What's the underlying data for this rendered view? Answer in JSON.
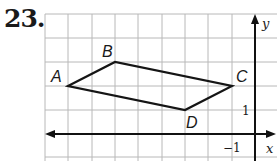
{
  "problem": {
    "number": "23."
  },
  "graph": {
    "origin_px": [
      255,
      134
    ],
    "unit_px": 23.4,
    "x_range": [
      -9,
      0.9
    ],
    "y_range": [
      -1,
      5
    ],
    "axis_labels": {
      "x": "x",
      "y": "y"
    },
    "tick_labels": {
      "x": "−1",
      "y": "1"
    },
    "grid_color": "#b8b8b8",
    "line_color": "#151515"
  },
  "figure": {
    "type": "parallelogram",
    "vertices": [
      {
        "label": "A",
        "x": -8,
        "y": 2
      },
      {
        "label": "B",
        "x": -6,
        "y": 3
      },
      {
        "label": "C",
        "x": -1,
        "y": 2
      },
      {
        "label": "D",
        "x": -3,
        "y": 1
      }
    ]
  }
}
